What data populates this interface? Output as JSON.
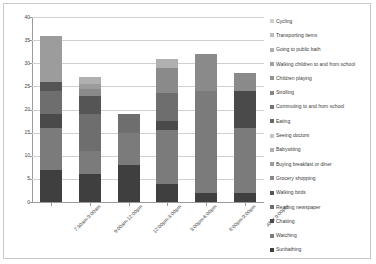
{
  "chart_data": {
    "type": "bar",
    "stacked": true,
    "title": "",
    "xlabel": "",
    "ylabel": "",
    "ylim": [
      0,
      40
    ],
    "ytick_labels": [
      "0",
      "5",
      "10",
      "15",
      "20",
      "25",
      "30",
      "35",
      "40"
    ],
    "ytick_values": [
      0,
      5,
      10,
      15,
      20,
      25,
      30,
      35,
      40
    ],
    "grid": true,
    "legend_position": "right",
    "categories": [
      "7:30am-9:00am",
      "9:00am-12:00pm",
      "12:00pm-3:00pm",
      "3:00pm-6:00pm",
      "6:00pm-9:00pm",
      "After 9:00pm"
    ],
    "series": [
      {
        "name": "Sunbathing",
        "color": "#3f3f3f",
        "values": [
          7,
          6,
          8,
          4,
          2,
          2
        ]
      },
      {
        "name": "Watching",
        "color": "#7b7b7b",
        "values": [
          9,
          5,
          7,
          11.5,
          22,
          14
        ]
      },
      {
        "name": "Chatting",
        "color": "#4a4a4a",
        "values": [
          3,
          0,
          0,
          2,
          0,
          8
        ]
      },
      {
        "name": "Reading newspaper",
        "color": "#6e6e6e",
        "values": [
          5,
          8,
          4,
          6,
          0,
          0
        ]
      },
      {
        "name": "Walking birds",
        "color": "#555555",
        "values": [
          2,
          4,
          0,
          0,
          0,
          0
        ]
      },
      {
        "name": "Grocery shopping",
        "color": "#8a8a8a",
        "values": [
          0,
          1.5,
          0,
          5.5,
          8,
          4
        ]
      },
      {
        "name": "Buying breakfast or diner",
        "color": "#9c9c9c",
        "values": [
          10,
          1,
          0,
          0,
          0,
          0
        ]
      },
      {
        "name": "Babysitting",
        "color": "#b0b0b0",
        "values": [
          0,
          1.5,
          0,
          2,
          0,
          0
        ]
      },
      {
        "name": "Seeing doctors",
        "color": "#c4c4c4",
        "values": [
          0,
          0,
          0,
          0,
          0,
          0
        ]
      },
      {
        "name": "Eating",
        "color": "#686868",
        "values": [
          0,
          0,
          0,
          0,
          0,
          0
        ]
      },
      {
        "name": "Commuting  to and from school",
        "color": "#747474",
        "values": [
          0,
          0,
          0,
          0,
          0,
          0
        ]
      },
      {
        "name": "Strolling",
        "color": "#868686",
        "values": [
          0,
          0,
          0,
          0,
          0,
          0
        ]
      },
      {
        "name": "Children playing",
        "color": "#929292",
        "values": [
          0,
          0,
          0,
          0,
          0,
          0
        ]
      },
      {
        "name": "Walking children to and from school",
        "color": "#a2a2a2",
        "values": [
          0,
          0,
          0,
          0,
          0,
          0
        ]
      },
      {
        "name": "Going to public bath",
        "color": "#aeaeae",
        "values": [
          0,
          0,
          0,
          0,
          0,
          0
        ]
      },
      {
        "name": "Transporting items",
        "color": "#bdbdbd",
        "values": [
          0,
          0,
          0,
          0,
          0,
          0
        ]
      },
      {
        "name": "Cycling",
        "color": "#cfcfcf",
        "values": [
          0,
          0,
          0,
          0,
          0,
          0
        ]
      }
    ],
    "totals": [
      36,
      27,
      19,
      31,
      32,
      28
    ]
  },
  "legend": {
    "items": [
      "Cycling",
      "Transporting items",
      "Going to public bath",
      "Walking children to and from school",
      "Children playing",
      "Strolling",
      "Commuting  to and from school",
      "Eating",
      "Seeing doctors",
      "Babysitting",
      "Buying breakfast or diner",
      "Grocery shopping",
      "Walking birds",
      "Reading newspaper",
      "Chatting",
      "Watching",
      "Sunbathing"
    ]
  }
}
